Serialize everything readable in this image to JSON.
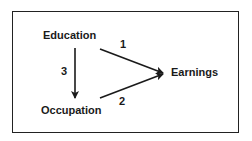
{
  "diagram": {
    "type": "path-diagram",
    "nodes": [
      {
        "id": "education",
        "label": "Education"
      },
      {
        "id": "occupation",
        "label": "Occupation"
      },
      {
        "id": "earnings",
        "label": "Earnings"
      }
    ],
    "edges": [
      {
        "id": "edge-1",
        "from": "education",
        "to": "earnings",
        "label": "1"
      },
      {
        "id": "edge-2",
        "from": "occupation",
        "to": "earnings",
        "label": "2"
      },
      {
        "id": "edge-3",
        "from": "education",
        "to": "occupation",
        "label": "3"
      }
    ],
    "colors": {
      "stroke": "#1a1a1a",
      "text": "#1a1a1a",
      "background": "#ffffff",
      "border": "#222222"
    }
  }
}
